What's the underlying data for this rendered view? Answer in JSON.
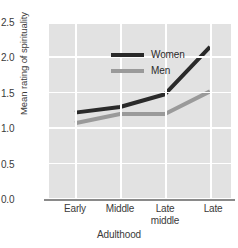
{
  "chart_data": {
    "type": "line",
    "title": "",
    "xlabel": "Adulthood",
    "ylabel": "Mean rating of spirituality",
    "categories": [
      "Early",
      "Middle",
      "Late middle",
      "Late"
    ],
    "category_lines": [
      [
        "Early"
      ],
      [
        "Middle"
      ],
      [
        "Late",
        "middle"
      ],
      [
        "Late"
      ]
    ],
    "yticks": [
      "0.0",
      "0.5",
      "1.0",
      "1.5",
      "2.0",
      "2.5"
    ],
    "ytick_values": [
      0.0,
      0.5,
      1.0,
      1.5,
      2.0,
      2.5
    ],
    "ylim": [
      0.0,
      2.5
    ],
    "grid": "white gridlines on gray panel",
    "legend_position": "upper-left inside plot",
    "series": [
      {
        "name": "Women",
        "color": "#2a2a2a",
        "values": [
          1.22,
          1.3,
          1.48,
          2.15
        ]
      },
      {
        "name": "Men",
        "color": "#9a9a9a",
        "values": [
          1.07,
          1.2,
          1.2,
          1.52
        ]
      }
    ],
    "panel_color": "#e2e2e2",
    "gridline_color": "#ffffff",
    "axis_color": "#8a8a8a"
  },
  "legend": {
    "items": [
      {
        "label": "Women"
      },
      {
        "label": "Men"
      }
    ]
  }
}
